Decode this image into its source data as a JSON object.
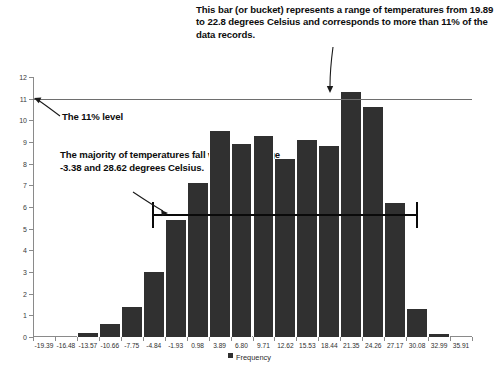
{
  "chart_data": {
    "type": "bar",
    "title": "",
    "xlabel": "",
    "ylabel": "",
    "ylim": [
      0,
      12
    ],
    "yticks": [
      0,
      1,
      2,
      3,
      4,
      5,
      6,
      7,
      8,
      9,
      10,
      11,
      12
    ],
    "grid": false,
    "legend_position": "bottom",
    "legend": [
      "Frequency"
    ],
    "categories": [
      "-19.39",
      "-16.48",
      "-13.57",
      "-10.66",
      "-7.75",
      "-4.84",
      "-1.93",
      "0.98",
      "3.89",
      "6.80",
      "9.71",
      "12.62",
      "15.53",
      "18.44",
      "21.35",
      "24.26",
      "27.17",
      "30.08",
      "32.99",
      "35.91"
    ],
    "values": [
      0,
      0,
      0.2,
      0.6,
      1.4,
      3.0,
      5.4,
      7.1,
      9.5,
      8.9,
      9.3,
      8.2,
      9.1,
      8.8,
      11.3,
      10.6,
      6.2,
      1.3,
      0.15,
      0
    ],
    "annotations": [
      {
        "name": "bucket-callout",
        "text": "This bar (or bucket) represents a range of temperatures from 19.89 to 22.8 degrees Celsius and corresponds to more than 11% of the data records.",
        "points_to_category": "21.35"
      },
      {
        "name": "level-callout",
        "text": "The 11% level",
        "points_to_value": 11
      },
      {
        "name": "majority-callout",
        "text": "The majority of temperatures fall within the range -3.38 and 28.62 degrees Celsius.",
        "range_low": -3.38,
        "range_high": 28.62
      }
    ],
    "reference_lines": [
      {
        "name": "eleven-percent-line",
        "value": 11,
        "color": "#6e6e6e"
      },
      {
        "name": "majority-range-line",
        "value": 5.7,
        "color": "#0a0a0a"
      }
    ],
    "colors": {
      "bar": "#303030",
      "axis": "#8a8a8a",
      "text": "#0d0d0d",
      "level_line": "#6e6e6e",
      "range_line": "#0a0a0a"
    }
  }
}
